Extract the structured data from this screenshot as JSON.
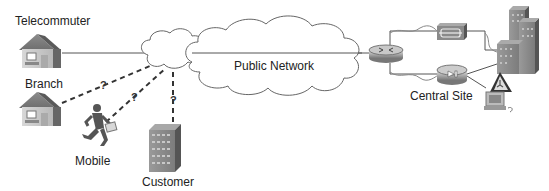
{
  "labels": {
    "telecommuter": "Telecommuter",
    "branch": "Branch",
    "mobile": "Mobile",
    "customer": "Customer",
    "public_network": "Public Network",
    "central_site": "Central Site"
  },
  "unknown_marker": "?",
  "nodes": [
    {
      "id": "telecommuter",
      "icon": "house-icon"
    },
    {
      "id": "branch",
      "icon": "house-icon"
    },
    {
      "id": "mobile",
      "icon": "running-person-icon"
    },
    {
      "id": "customer",
      "icon": "building-icon"
    },
    {
      "id": "public_network",
      "icon": "cloud-icon"
    },
    {
      "id": "central_router",
      "icon": "router-icon"
    },
    {
      "id": "central_firewall",
      "icon": "firewall-icon"
    },
    {
      "id": "central_vpn_concentrator",
      "icon": "vpn-concentrator-icon"
    },
    {
      "id": "central_building",
      "icon": "headquarters-building-icon"
    },
    {
      "id": "central_workstation",
      "icon": "workstation-icon"
    }
  ],
  "links": [
    {
      "from": "telecommuter",
      "to": "central_router",
      "style": "solid"
    },
    {
      "from": "branch",
      "to": "public_network",
      "style": "dashed",
      "label": "?"
    },
    {
      "from": "mobile",
      "to": "public_network",
      "style": "dashed",
      "label": "?"
    },
    {
      "from": "customer",
      "to": "public_network",
      "style": "dashed",
      "label": "?"
    }
  ]
}
